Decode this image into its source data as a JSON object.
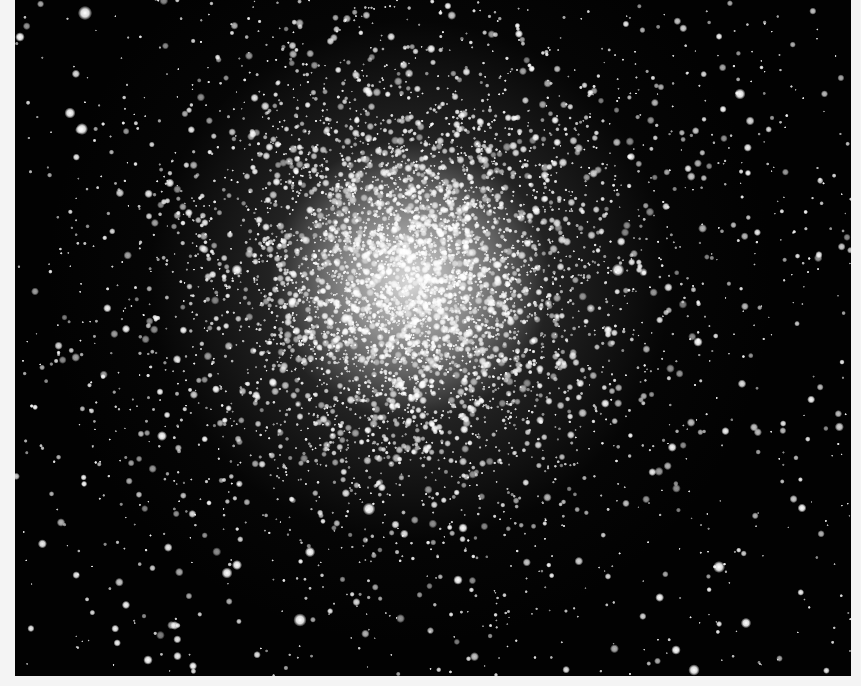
{
  "image": {
    "subject": "globular star cluster",
    "background_color": "#020202",
    "frame_color": "#f4f4f4",
    "photo_bounds": {
      "x": 15,
      "y": 0,
      "width": 836,
      "height": 676
    },
    "cluster_center": {
      "x": 410,
      "y": 280
    },
    "core_radius": 70,
    "halo_radius": 260,
    "star_color": "#ffffff"
  },
  "generation": {
    "seed": 20240611,
    "field_stars": 900,
    "cluster_stars": 5200,
    "bright_stars": [
      {
        "x": 85,
        "y": 13,
        "r": 4.5
      },
      {
        "x": 70,
        "y": 113,
        "r": 3.5
      },
      {
        "x": 82,
        "y": 129,
        "r": 3.8
      },
      {
        "x": 20,
        "y": 37,
        "r": 3
      },
      {
        "x": 237,
        "y": 270,
        "r": 3.5
      },
      {
        "x": 618,
        "y": 270,
        "r": 4
      },
      {
        "x": 740,
        "y": 94,
        "r": 3.5
      },
      {
        "x": 369,
        "y": 509,
        "r": 4
      },
      {
        "x": 300,
        "y": 620,
        "r": 4.2
      },
      {
        "x": 227,
        "y": 573,
        "r": 3.5
      },
      {
        "x": 237,
        "y": 565,
        "r": 3.2
      },
      {
        "x": 719,
        "y": 567,
        "r": 3.8
      },
      {
        "x": 746,
        "y": 623,
        "r": 3.3
      },
      {
        "x": 694,
        "y": 670,
        "r": 3.6
      },
      {
        "x": 162,
        "y": 436,
        "r": 3.2
      },
      {
        "x": 310,
        "y": 552,
        "r": 3.3
      },
      {
        "x": 463,
        "y": 528,
        "r": 3
      },
      {
        "x": 458,
        "y": 580,
        "r": 3
      },
      {
        "x": 698,
        "y": 342,
        "r": 3
      },
      {
        "x": 608,
        "y": 330,
        "r": 2.8
      },
      {
        "x": 802,
        "y": 508,
        "r": 2.8
      },
      {
        "x": 676,
        "y": 650,
        "r": 3
      },
      {
        "x": 148,
        "y": 660,
        "r": 3
      },
      {
        "x": 193,
        "y": 666,
        "r": 2.6
      }
    ]
  }
}
